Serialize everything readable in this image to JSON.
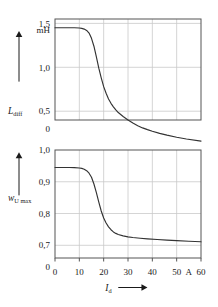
{
  "figure": {
    "name": "differential-inductance-and-voltage-utilisation-vs-direct-current",
    "background": "#ffffff",
    "frame_color": "#555555",
    "grid_color": "#c9c9c9",
    "curve_color": "#333333",
    "text_color": "#1a1a1a"
  },
  "shared_axis": {
    "label": "I",
    "label_sub": "d",
    "unit": "A",
    "unit_position_tick": 50,
    "arrow": "right-arrow",
    "ticks": [
      0,
      10,
      20,
      30,
      40,
      50,
      60
    ],
    "tick_labels": [
      "0",
      "10",
      "20",
      "30",
      "40",
      "50",
      "60"
    ],
    "xlim": [
      0,
      60
    ]
  },
  "chart_data": [
    {
      "type": "line",
      "name": "differential-inductance",
      "title": "",
      "ylabel": "L",
      "ylabel_sub": "diff",
      "yunit": "mH",
      "xlabel": "I",
      "xlabel_sub": "d",
      "xunit": "A",
      "xlim": [
        0,
        60
      ],
      "ylim": [
        0.4,
        1.55
      ],
      "y_axis_break": true,
      "y_break_between": [
        0,
        0.5
      ],
      "ytick_labels": [
        "0",
        "0,5",
        "1,0",
        "1,5"
      ],
      "yticks": [
        0,
        0.5,
        1.0,
        1.5
      ],
      "grid": true,
      "legend": "none",
      "x": [
        0,
        2,
        4,
        6,
        8,
        10,
        11,
        12,
        13,
        14,
        15,
        16,
        17,
        18,
        19,
        20,
        21,
        22,
        23,
        24,
        25,
        26,
        28,
        30,
        32,
        34,
        36,
        38,
        40,
        43,
        46,
        50,
        54,
        60
      ],
      "y": [
        1.45,
        1.45,
        1.45,
        1.45,
        1.45,
        1.447,
        1.443,
        1.435,
        1.42,
        1.39,
        1.33,
        1.24,
        1.12,
        0.99,
        0.88,
        0.78,
        0.705,
        0.64,
        0.59,
        0.55,
        0.515,
        0.485,
        0.44,
        0.4,
        0.365,
        0.335,
        0.31,
        0.29,
        0.272,
        0.248,
        0.228,
        0.204,
        0.184,
        0.16
      ]
    },
    {
      "type": "line",
      "name": "voltage-utilisation-maximum",
      "title": "",
      "ylabel": "w",
      "ylabel_sub": "U max",
      "yunit": "",
      "xlabel": "I",
      "xlabel_sub": "d",
      "xunit": "A",
      "xlim": [
        0,
        60
      ],
      "ylim": [
        0.66,
        1.0
      ],
      "y_axis_break": true,
      "y_break_between": [
        0,
        0.7
      ],
      "ytick_labels": [
        "0",
        "0,7",
        "0,8",
        "0,9",
        "1,0"
      ],
      "yticks": [
        0,
        0.7,
        0.8,
        0.9,
        1.0
      ],
      "grid": true,
      "legend": "none",
      "x": [
        0,
        2,
        4,
        6,
        8,
        10,
        11,
        12,
        13,
        14,
        15,
        16,
        17,
        18,
        19,
        20,
        21,
        22,
        23,
        24,
        25,
        26,
        28,
        30,
        32,
        35,
        38,
        42,
        46,
        50,
        55,
        60
      ],
      "y": [
        0.945,
        0.945,
        0.945,
        0.945,
        0.9445,
        0.9435,
        0.942,
        0.9395,
        0.935,
        0.927,
        0.914,
        0.893,
        0.866,
        0.836,
        0.808,
        0.786,
        0.77,
        0.758,
        0.749,
        0.742,
        0.7375,
        0.734,
        0.7295,
        0.7265,
        0.7245,
        0.7222,
        0.7203,
        0.7182,
        0.7163,
        0.7148,
        0.7128,
        0.711
      ]
    }
  ]
}
